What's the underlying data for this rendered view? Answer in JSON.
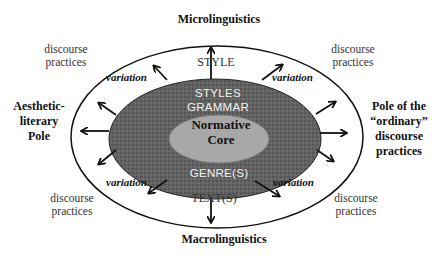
{
  "diagram": {
    "top_label": "Microlinguistics",
    "bottom_label": "Macrolinguistics",
    "left_pole": [
      "Aesthetic-",
      "literary",
      "Pole"
    ],
    "right_pole": [
      "Pole of the",
      "“ordinary”",
      "discourse",
      "practices"
    ],
    "corner_labels": {
      "top_left": [
        "discourse",
        "practices"
      ],
      "top_right": [
        "discourse",
        "practices"
      ],
      "bottom_left": [
        "discourse",
        "practices"
      ],
      "bottom_right": [
        "discourse",
        "practices"
      ]
    },
    "variation_labels": {
      "top_left": "variation",
      "top_right": "variation",
      "bottom_left": "variation",
      "bottom_right": "variation"
    },
    "outer_ring": {
      "top": "STYLE",
      "bottom": "TEXT(S)"
    },
    "middle_ring": {
      "line1": "STYLES",
      "line2": "GRAMMAR",
      "bottom": "GENRE(S)"
    },
    "core": [
      "Normative",
      "Core"
    ],
    "colors": {
      "outer_fill": "#ffffff",
      "middle_fill": "#5e5e5e",
      "core_fill": "#a9a9a9",
      "stroke": "#111111"
    }
  }
}
